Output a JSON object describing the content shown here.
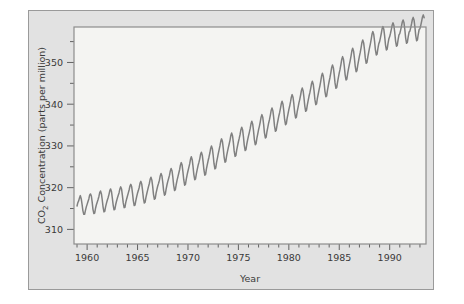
{
  "figure": {
    "background_color": "#e2e2e2",
    "plot_background_color": "#f4f4f2",
    "frame_color": "#8c8c8c",
    "line_color": "#808080"
  },
  "chart_data": {
    "type": "line",
    "title": "",
    "xlabel": "Year",
    "ylabel_prefix": "CO",
    "ylabel_sub": "2",
    "ylabel_suffix": " Concentration (parts per million)",
    "ylabel_full": "CO2 Concentration (parts per million)",
    "xlim": [
      1958.7,
      1993.6
    ],
    "ylim": [
      306.5,
      358.5
    ],
    "xticks_major": [
      1960,
      1965,
      1970,
      1975,
      1980,
      1985,
      1990
    ],
    "xticklabels": [
      "1960",
      "1965",
      "1970",
      "1975",
      "1980",
      "1985",
      "1990"
    ],
    "xticks_minor_step": 1,
    "yticks_major": [
      310,
      320,
      330,
      340,
      350
    ],
    "yticklabels": [
      "310",
      "320",
      "330",
      "340",
      "350"
    ],
    "yticks_minor": [
      315,
      325,
      335,
      345,
      355
    ],
    "grid": false,
    "legend": null,
    "series": [
      {
        "name": "Mauna Loa monthly mean CO2",
        "x": [
          1959.0,
          1959.08,
          1959.17,
          1959.25,
          1959.33,
          1959.42,
          1959.5,
          1959.58,
          1959.67,
          1959.75,
          1959.83,
          1959.92,
          1960.0,
          1960.08,
          1960.17,
          1960.25,
          1960.33,
          1960.42,
          1960.5,
          1960.58,
          1960.67,
          1960.75,
          1960.83,
          1960.92,
          1961.0,
          1961.08,
          1961.17,
          1961.25,
          1961.33,
          1961.42,
          1961.5,
          1961.58,
          1961.67,
          1961.75,
          1961.83,
          1961.92,
          1962.0,
          1962.08,
          1962.17,
          1962.25,
          1962.33,
          1962.42,
          1962.5,
          1962.58,
          1962.67,
          1962.75,
          1962.83,
          1962.92,
          1963.0,
          1963.08,
          1963.17,
          1963.25,
          1963.33,
          1963.42,
          1963.5,
          1963.58,
          1963.67,
          1963.75,
          1963.83,
          1963.92,
          1964.0,
          1964.08,
          1964.17,
          1964.25,
          1964.33,
          1964.42,
          1964.5,
          1964.58,
          1964.67,
          1964.75,
          1964.83,
          1964.92,
          1965.0,
          1965.08,
          1965.17,
          1965.25,
          1965.33,
          1965.42,
          1965.5,
          1965.58,
          1965.67,
          1965.75,
          1965.83,
          1965.92,
          1966.0,
          1966.08,
          1966.17,
          1966.25,
          1966.33,
          1966.42,
          1966.5,
          1966.58,
          1966.67,
          1966.75,
          1966.83,
          1966.92,
          1967.0,
          1967.08,
          1967.17,
          1967.25,
          1967.33,
          1967.42,
          1967.5,
          1967.58,
          1967.67,
          1967.75,
          1967.83,
          1967.92,
          1968.0,
          1968.08,
          1968.17,
          1968.25,
          1968.33,
          1968.42,
          1968.5,
          1968.58,
          1968.67,
          1968.75,
          1968.83,
          1968.92,
          1969.0,
          1969.08,
          1969.17,
          1969.25,
          1969.33,
          1969.42,
          1969.5,
          1969.58,
          1969.67,
          1969.75,
          1969.83,
          1969.92,
          1970.0,
          1970.08,
          1970.17,
          1970.25,
          1970.33,
          1970.42,
          1970.5,
          1970.58,
          1970.67,
          1970.75,
          1970.83,
          1970.92,
          1971.0,
          1971.08,
          1971.17,
          1971.25,
          1971.33,
          1971.42,
          1971.5,
          1971.58,
          1971.67,
          1971.75,
          1971.83,
          1971.92,
          1972.0,
          1972.08,
          1972.17,
          1972.25,
          1972.33,
          1972.42,
          1972.5,
          1972.58,
          1972.67,
          1972.75,
          1972.83,
          1972.92,
          1973.0,
          1973.08,
          1973.17,
          1973.25,
          1973.33,
          1973.42,
          1973.5,
          1973.58,
          1973.67,
          1973.75,
          1973.83,
          1973.92,
          1974.0,
          1974.08,
          1974.17,
          1974.25,
          1974.33,
          1974.42,
          1974.5,
          1974.58,
          1974.67,
          1974.75,
          1974.83,
          1974.92,
          1975.0,
          1975.08,
          1975.17,
          1975.25,
          1975.33,
          1975.42,
          1975.5,
          1975.58,
          1975.67,
          1975.75,
          1975.83,
          1975.92,
          1976.0,
          1976.08,
          1976.17,
          1976.25,
          1976.33,
          1976.42,
          1976.5,
          1976.58,
          1976.67,
          1976.75,
          1976.83,
          1976.92,
          1977.0,
          1977.08,
          1977.17,
          1977.25,
          1977.33,
          1977.42,
          1977.5,
          1977.58,
          1977.67,
          1977.75,
          1977.83,
          1977.92,
          1978.0,
          1978.08,
          1978.17,
          1978.25,
          1978.33,
          1978.42,
          1978.5,
          1978.58,
          1978.67,
          1978.75,
          1978.83,
          1978.92,
          1979.0,
          1979.08,
          1979.17,
          1979.25,
          1979.33,
          1979.42,
          1979.5,
          1979.58,
          1979.67,
          1979.75,
          1979.83,
          1979.92,
          1980.0,
          1980.08,
          1980.17,
          1980.25,
          1980.33,
          1980.42,
          1980.5,
          1980.58,
          1980.67,
          1980.75,
          1980.83,
          1980.92,
          1981.0,
          1981.08,
          1981.17,
          1981.25,
          1981.33,
          1981.42,
          1981.5,
          1981.58,
          1981.67,
          1981.75,
          1981.83,
          1981.92,
          1982.0,
          1982.08,
          1982.17,
          1982.25,
          1982.33,
          1982.42,
          1982.5,
          1982.58,
          1982.67,
          1982.75,
          1982.83,
          1982.92,
          1983.0,
          1983.08,
          1983.17,
          1983.25,
          1983.33,
          1983.42,
          1983.5,
          1983.58,
          1983.67,
          1983.75,
          1983.83,
          1983.92,
          1984.0,
          1984.08,
          1984.17,
          1984.25,
          1984.33,
          1984.42,
          1984.5,
          1984.58,
          1984.67,
          1984.75,
          1984.83,
          1984.92,
          1985.0,
          1985.08,
          1985.17,
          1985.25,
          1985.33,
          1985.42,
          1985.5,
          1985.58,
          1985.67,
          1985.75,
          1985.83,
          1985.92,
          1986.0,
          1986.08,
          1986.17,
          1986.25,
          1986.33,
          1986.42,
          1986.5,
          1986.58,
          1986.67,
          1986.75,
          1986.83,
          1986.92,
          1987.0,
          1987.08,
          1987.17,
          1987.25,
          1987.33,
          1987.42,
          1987.5,
          1987.58,
          1987.67,
          1987.75,
          1987.83,
          1987.92,
          1988.0,
          1988.08,
          1988.17,
          1988.25,
          1988.33,
          1988.42,
          1988.5,
          1988.58,
          1988.67,
          1988.75,
          1988.83,
          1988.92,
          1989.0,
          1989.08,
          1989.17,
          1989.25,
          1989.33,
          1989.42,
          1989.5,
          1989.58,
          1989.67,
          1989.75,
          1989.83,
          1989.92,
          1990.0,
          1990.08,
          1990.17,
          1990.25,
          1990.33,
          1990.42,
          1990.5,
          1990.58,
          1990.67,
          1990.75,
          1990.83,
          1990.92,
          1991.0,
          1991.08,
          1991.17,
          1991.25,
          1991.33,
          1991.42,
          1991.5,
          1991.58,
          1991.67,
          1991.75,
          1991.83,
          1991.92,
          1992.0,
          1992.08,
          1992.17,
          1992.25,
          1992.33,
          1992.42,
          1992.5,
          1992.58,
          1992.67,
          1992.75,
          1992.83,
          1992.92,
          1993.0,
          1993.08,
          1993.17,
          1993.25,
          1993.33,
          1993.42
        ],
        "values": [
          315.6,
          316.4,
          316.9,
          317.6,
          318.1,
          317.3,
          316.0,
          314.5,
          313.6,
          313.6,
          314.5,
          315.4,
          316.0,
          316.6,
          317.3,
          318.2,
          318.5,
          318.0,
          316.6,
          314.8,
          313.8,
          313.9,
          315.0,
          315.9,
          316.5,
          317.1,
          317.9,
          318.8,
          319.2,
          318.5,
          317.1,
          315.4,
          314.2,
          314.3,
          315.4,
          316.3,
          317.0,
          317.6,
          318.4,
          319.3,
          319.7,
          319.0,
          317.5,
          315.9,
          314.7,
          314.8,
          315.9,
          316.8,
          317.5,
          318.1,
          318.8,
          319.7,
          320.2,
          319.6,
          318.1,
          316.4,
          315.2,
          315.3,
          316.4,
          317.3,
          318.0,
          318.7,
          319.5,
          320.4,
          320.8,
          320.2,
          318.7,
          316.9,
          315.7,
          315.8,
          316.9,
          317.9,
          318.7,
          319.3,
          320.1,
          321.1,
          321.5,
          320.8,
          319.3,
          317.5,
          316.3,
          316.5,
          317.6,
          318.6,
          319.4,
          320.2,
          321.0,
          322.0,
          322.5,
          321.8,
          320.3,
          318.4,
          317.2,
          317.4,
          318.6,
          319.6,
          320.4,
          321.0,
          321.8,
          322.8,
          323.4,
          322.8,
          321.3,
          319.4,
          318.2,
          318.4,
          319.6,
          320.7,
          321.5,
          322.2,
          323.0,
          324.0,
          324.6,
          324.0,
          322.5,
          320.6,
          319.3,
          319.5,
          320.7,
          321.8,
          322.6,
          323.4,
          324.3,
          325.4,
          326.0,
          325.4,
          323.8,
          321.9,
          320.6,
          320.8,
          322.0,
          323.1,
          324.0,
          324.8,
          325.7,
          326.8,
          327.4,
          326.7,
          325.1,
          323.2,
          321.9,
          322.1,
          323.3,
          324.4,
          325.3,
          326.0,
          326.9,
          328.0,
          328.5,
          327.8,
          326.2,
          324.3,
          323.0,
          323.2,
          324.5,
          325.6,
          326.5,
          327.3,
          328.3,
          329.4,
          330.0,
          329.3,
          327.7,
          325.8,
          324.5,
          324.7,
          326.0,
          327.1,
          328.1,
          329.0,
          330.0,
          331.1,
          331.7,
          331.0,
          329.4,
          327.4,
          326.1,
          326.3,
          327.6,
          328.7,
          329.6,
          330.4,
          331.4,
          332.5,
          333.1,
          332.4,
          330.8,
          328.8,
          327.5,
          327.7,
          329.0,
          330.1,
          331.0,
          331.8,
          332.8,
          333.9,
          334.5,
          333.8,
          332.2,
          330.2,
          328.9,
          329.1,
          330.4,
          331.5,
          332.4,
          333.2,
          334.2,
          335.3,
          335.9,
          335.2,
          333.6,
          331.6,
          330.3,
          330.5,
          331.8,
          332.9,
          333.9,
          334.7,
          335.8,
          336.9,
          337.5,
          336.8,
          335.2,
          333.2,
          331.9,
          332.1,
          333.4,
          334.5,
          335.5,
          336.3,
          337.4,
          338.5,
          339.1,
          338.4,
          336.8,
          334.8,
          333.5,
          333.7,
          335.0,
          336.1,
          337.1,
          337.9,
          339.0,
          340.1,
          340.7,
          340.0,
          338.4,
          336.4,
          335.1,
          335.3,
          336.6,
          337.7,
          338.7,
          339.5,
          340.6,
          341.7,
          342.3,
          341.6,
          340.0,
          338.0,
          336.7,
          336.9,
          338.2,
          339.3,
          340.3,
          341.1,
          342.2,
          343.3,
          343.9,
          343.2,
          341.6,
          339.6,
          338.3,
          338.5,
          339.8,
          340.9,
          341.9,
          342.7,
          343.8,
          344.9,
          345.5,
          344.8,
          343.2,
          341.2,
          339.9,
          340.1,
          341.4,
          342.5,
          343.5,
          344.4,
          345.6,
          346.8,
          347.4,
          346.7,
          345.1,
          343.1,
          341.8,
          342.0,
          343.3,
          344.5,
          345.5,
          346.4,
          347.6,
          348.8,
          349.4,
          348.7,
          347.1,
          345.1,
          343.8,
          344.0,
          345.3,
          346.5,
          347.5,
          348.4,
          349.6,
          350.8,
          351.4,
          350.7,
          349.1,
          347.1,
          345.8,
          346.0,
          347.3,
          348.5,
          349.5,
          350.4,
          351.6,
          352.8,
          353.4,
          352.7,
          351.1,
          349.1,
          347.8,
          348.0,
          349.3,
          350.5,
          351.5,
          352.4,
          353.6,
          354.8,
          355.4,
          354.7,
          353.1,
          351.1,
          349.8,
          350.0,
          351.3,
          352.5,
          353.5,
          354.4,
          355.6,
          356.8,
          357.4,
          356.7,
          355.1,
          353.1,
          351.8,
          352.0,
          353.3,
          354.5,
          355.0,
          355.9,
          357.0,
          358.1,
          358.6,
          357.9,
          356.3,
          354.3,
          353.0,
          353.2,
          354.5,
          355.7,
          356.2,
          357.0,
          358.0,
          359.0,
          359.5,
          358.8,
          357.2,
          355.2,
          353.9,
          354.1,
          355.4,
          356.6,
          356.9,
          357.7,
          358.7,
          359.7,
          360.2,
          359.5,
          357.9,
          355.9,
          354.6,
          354.8,
          356.1,
          357.3,
          357.5,
          358.3,
          359.3,
          360.3,
          360.8,
          360.1,
          358.5,
          356.5,
          355.2,
          355.4,
          356.7,
          357.9,
          358.1,
          358.9,
          359.9,
          360.9,
          361.4,
          360.7
        ]
      }
    ]
  }
}
